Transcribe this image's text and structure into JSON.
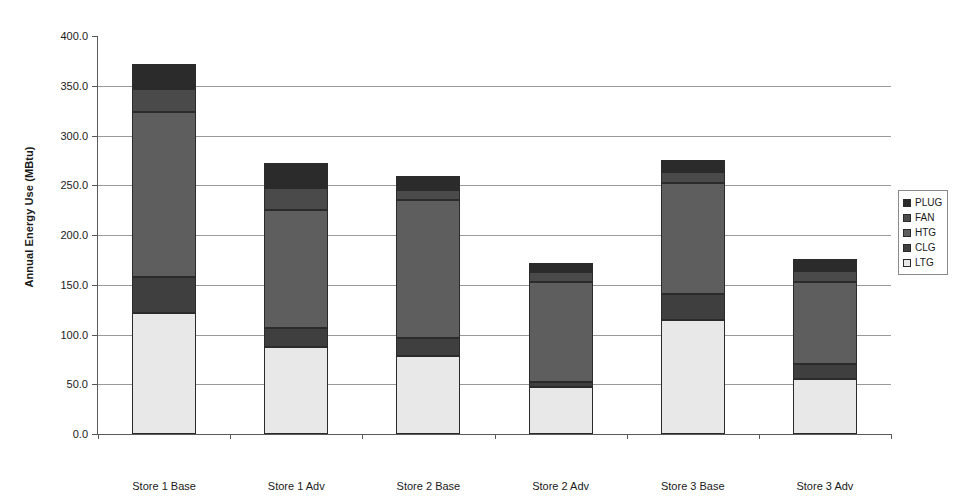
{
  "chart_data": {
    "type": "bar",
    "stacked": true,
    "title": "",
    "xlabel": "Store",
    "ylabel": "Annual Energy Use (MBtu)",
    "ylim": [
      0,
      400
    ],
    "ytick_step": 50,
    "ytick_labels": [
      "400.0",
      "350.0",
      "300.0",
      "250.0",
      "200.0",
      "150.0",
      "100.0",
      "50.0",
      "0.0"
    ],
    "ytick_values": [
      400,
      350,
      300,
      250,
      200,
      150,
      100,
      50,
      0
    ],
    "grid": true,
    "legend_position": "right",
    "categories": [
      "Store 1 Base",
      "Store 1 Adv",
      "Store 2 Base",
      "Store 2 Adv",
      "Store 3 Base",
      "Store 3 Adv"
    ],
    "stack_order_bottom_to_top": [
      "LTG",
      "CLG",
      "HTG",
      "FAN",
      "PLUG"
    ],
    "series": [
      {
        "name": "LTG",
        "color": "#e8e8e8",
        "values": [
          122,
          87,
          78,
          47,
          115,
          55
        ]
      },
      {
        "name": "CLG",
        "color": "#3f3f3f",
        "values": [
          36,
          20,
          18,
          5,
          26,
          15
        ]
      },
      {
        "name": "HTG",
        "color": "#5e5e5e",
        "values": [
          166,
          118,
          139,
          101,
          111,
          83
        ]
      },
      {
        "name": "FAN",
        "color": "#4a4a4a",
        "values": [
          23,
          22,
          10,
          10,
          11,
          11
        ]
      },
      {
        "name": "PLUG",
        "color": "#2b2b2b",
        "values": [
          25,
          25,
          14,
          9,
          12,
          12
        ]
      }
    ],
    "totals": [
      372,
      272,
      259,
      172,
      275,
      176
    ]
  },
  "legend": {
    "items": [
      {
        "label": "PLUG"
      },
      {
        "label": "FAN"
      },
      {
        "label": "HTG"
      },
      {
        "label": "CLG"
      },
      {
        "label": "LTG"
      }
    ]
  }
}
